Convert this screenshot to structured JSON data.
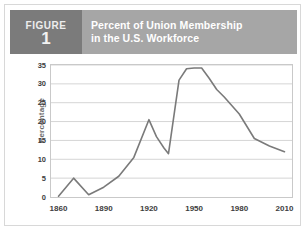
{
  "figure": {
    "label_word": "FIGURE",
    "number": "1",
    "title_line1": "Percent of Union Membership",
    "title_line2": "in the U.S. Workforce",
    "badge_color": "#7b7b7b",
    "title_bar_color": "#a6a6a6",
    "border_color": "#d8d8d8"
  },
  "chart_data": {
    "type": "line",
    "title": "Percent of Union Membership in the U.S. Workforce",
    "xlabel": "",
    "ylabel": "Percentage",
    "xlim": [
      1855,
      2015
    ],
    "ylim": [
      0,
      35
    ],
    "ytick_labels": [
      "0",
      "5",
      "10",
      "15",
      "20",
      "25",
      "30",
      "35"
    ],
    "yticks": [
      0,
      5,
      10,
      15,
      20,
      25,
      30,
      35
    ],
    "xtick_labels": [
      "1860",
      "1890",
      "1920",
      "1950",
      "1980",
      "2010"
    ],
    "xticks": [
      1860,
      1890,
      1920,
      1950,
      1980,
      2010
    ],
    "grid": "horizontal",
    "legend": "none",
    "line_color": "#7a7a7a",
    "series": [
      {
        "name": "Union membership",
        "x": [
          1860,
          1870,
          1880,
          1890,
          1900,
          1910,
          1920,
          1925,
          1930,
          1933,
          1940,
          1945,
          1950,
          1955,
          1960,
          1965,
          1970,
          1980,
          1990,
          2000,
          2010
        ],
        "values": [
          0.2,
          5.0,
          0.6,
          2.6,
          5.5,
          10.5,
          20.5,
          16.0,
          13.0,
          11.5,
          31.0,
          34.0,
          34.2,
          34.2,
          31.5,
          28.5,
          26.5,
          22.0,
          15.5,
          13.5,
          12.0
        ]
      }
    ]
  }
}
